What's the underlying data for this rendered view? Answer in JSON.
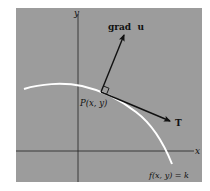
{
  "diagram": {
    "background_color": "#9c9c9c",
    "curve_color": "#ffffff",
    "axis_color": "#222222",
    "arrow_color": "#111111",
    "labels": {
      "x_axis": "x",
      "y_axis": "y",
      "gradient": "grad  u",
      "tangent": "T",
      "point": "P(x, y)",
      "level_curve": "f(x, y) = k"
    },
    "elements": {
      "point": "P",
      "right_angle_marker": true
    }
  }
}
